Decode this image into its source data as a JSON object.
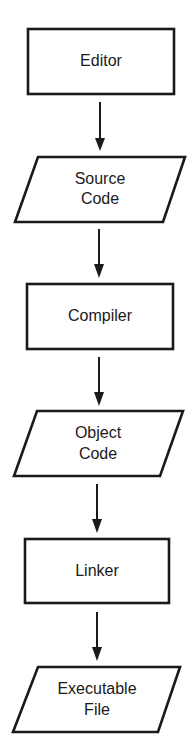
{
  "diagram": {
    "type": "flowchart",
    "direction": "top-to-bottom",
    "nodes": [
      {
        "id": "editor",
        "shape": "rectangle",
        "lines": [
          "Editor"
        ]
      },
      {
        "id": "source_code",
        "shape": "parallelogram",
        "lines": [
          "Source",
          "Code"
        ]
      },
      {
        "id": "compiler",
        "shape": "rectangle",
        "lines": [
          "Compiler"
        ]
      },
      {
        "id": "object_code",
        "shape": "parallelogram",
        "lines": [
          "Object",
          "Code"
        ]
      },
      {
        "id": "linker",
        "shape": "rectangle",
        "lines": [
          "Linker"
        ]
      },
      {
        "id": "executable_file",
        "shape": "parallelogram",
        "lines": [
          "Executable",
          "File"
        ]
      }
    ],
    "edges": [
      {
        "from": "editor",
        "to": "source_code"
      },
      {
        "from": "source_code",
        "to": "compiler"
      },
      {
        "from": "compiler",
        "to": "object_code"
      },
      {
        "from": "object_code",
        "to": "linker"
      },
      {
        "from": "linker",
        "to": "executable_file"
      }
    ],
    "colors": {
      "stroke": "#1a1a1a",
      "fill": "#ffffff",
      "background": "#ffffff"
    }
  }
}
